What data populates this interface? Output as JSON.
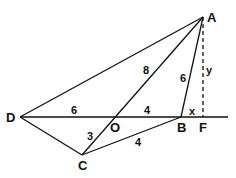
{
  "diagram": {
    "points": {
      "A": {
        "label": "A"
      },
      "B": {
        "label": "B"
      },
      "C": {
        "label": "C"
      },
      "D": {
        "label": "D"
      },
      "O": {
        "label": "O"
      },
      "F": {
        "label": "F"
      }
    },
    "segment_labels": {
      "DO": "6",
      "OB": "4",
      "AO": "8",
      "AB": "6",
      "OC": "3",
      "CB": "4",
      "BF": "x",
      "AF": "y"
    }
  }
}
